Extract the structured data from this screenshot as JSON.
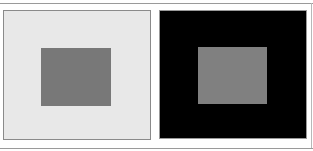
{
  "figure": {
    "type": "simultaneous-contrast-illusion",
    "panels": [
      {
        "name": "light-background-panel",
        "background_color": "#e8e8e8",
        "border_color": "#8a8a8a",
        "inner_square_color": "#787878"
      },
      {
        "name": "dark-background-panel",
        "background_color": "#000000",
        "border_color": "#9a9a9a",
        "inner_square_color": "#808080"
      }
    ]
  }
}
